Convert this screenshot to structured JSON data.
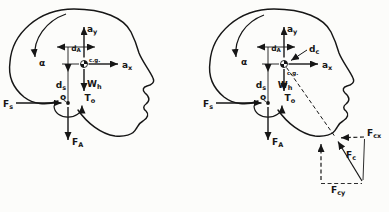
{
  "canvas": {
    "width": 389,
    "height": 212,
    "ink": "#161616",
    "paper": "#fcfcfa"
  },
  "left_diagram": {
    "labels": {
      "alpha": {
        "main": "α"
      },
      "ay": {
        "main": "a",
        "sub": "y"
      },
      "ax": {
        "main": "a",
        "sub": "x"
      },
      "dA": {
        "main": "d",
        "sub": "A"
      },
      "ds": {
        "main": "d",
        "sub": "s"
      },
      "cg": {
        "main": "c.g."
      },
      "Wh": {
        "main": "W",
        "sub": "h"
      },
      "o": {
        "main": "o"
      },
      "To": {
        "main": "T",
        "sub": "o"
      },
      "Fs": {
        "main": "F",
        "sub": "s"
      },
      "FA": {
        "main": "F",
        "sub": "A"
      }
    }
  },
  "right_diagram": {
    "labels": {
      "alpha": {
        "main": "α"
      },
      "ay": {
        "main": "a",
        "sub": "y"
      },
      "ax": {
        "main": "a",
        "sub": "x"
      },
      "dA": {
        "main": "d",
        "sub": "A"
      },
      "ds": {
        "main": "d",
        "sub": "s"
      },
      "cg": {
        "main": "c.g."
      },
      "Wh": {
        "main": "W",
        "sub": "h"
      },
      "o": {
        "main": "o"
      },
      "To": {
        "main": "T",
        "sub": "o"
      },
      "Fs": {
        "main": "F",
        "sub": "s"
      },
      "FA": {
        "main": "F",
        "sub": "A"
      },
      "dc": {
        "main": "d",
        "sub": "c"
      },
      "Fc": {
        "main": "F",
        "sub": "c"
      },
      "Fcx": {
        "main": "F",
        "sub": "cx"
      },
      "Fcy": {
        "main": "F",
        "sub": "cy"
      }
    }
  }
}
